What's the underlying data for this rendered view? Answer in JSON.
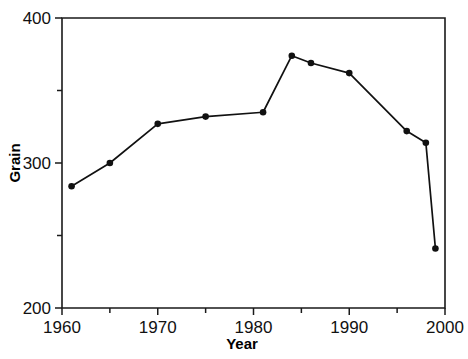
{
  "chart_data": {
    "type": "line",
    "title": "",
    "xlabel": "Year",
    "ylabel": "Grain",
    "xlim": [
      1960,
      2000
    ],
    "ylim": [
      200,
      400
    ],
    "grid": false,
    "legend": false,
    "x_ticks_major": [
      1960,
      1970,
      1980,
      1990,
      2000
    ],
    "x_tick_labels": [
      "1960",
      "1970",
      "1980",
      "1990",
      "2000"
    ],
    "x_ticks_minor": [
      1965,
      1975,
      1985,
      1995
    ],
    "y_ticks_major": [
      200,
      300,
      400
    ],
    "y_tick_labels": [
      "200",
      "300",
      "400"
    ],
    "y_ticks_minor": [
      250,
      350
    ],
    "series": [
      {
        "name": "Grain",
        "marker": "circle",
        "color": "#111111",
        "x": [
          1961,
          1965,
          1970,
          1975,
          1981,
          1984,
          1986,
          1990,
          1996,
          1998,
          1999
        ],
        "values": [
          284,
          300,
          327,
          332,
          335,
          374,
          369,
          362,
          322,
          314,
          241
        ]
      }
    ]
  },
  "axes": {
    "x_title": "Year",
    "y_title": "Grain"
  }
}
